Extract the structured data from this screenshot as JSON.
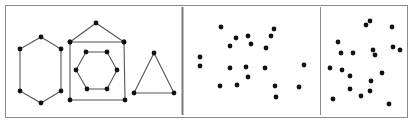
{
  "figure": {
    "frame": {
      "x": 5,
      "y": 5,
      "width": 402,
      "height": 112,
      "stroke": "#8a8a8a"
    },
    "separators": [
      {
        "x": 182.5,
        "y1": 7,
        "y2": 115,
        "stroke": "#7a7a7a",
        "width": 2
      },
      {
        "x": 320.5,
        "y1": 7,
        "y2": 115,
        "stroke": "#8a8a8a",
        "width": 1
      }
    ],
    "colors": {
      "edge": "#555555",
      "node": "#111111",
      "background": "#ffffff"
    },
    "panels": [
      {
        "name": "graph-panel",
        "shapes": [
          {
            "name": "hexagon-outer",
            "points": [
              [
                41,
                37
              ],
              [
                61,
                49
              ],
              [
                61,
                91
              ],
              [
                41,
                103
              ],
              [
                20,
                91
              ],
              [
                20,
                49
              ]
            ]
          },
          {
            "name": "house-roof",
            "points": [
              [
                70,
                42
              ],
              [
                96,
                23
              ],
              [
                124,
                42
              ]
            ],
            "open": true
          },
          {
            "name": "house-square",
            "points": [
              [
                70,
                42
              ],
              [
                124,
                42
              ],
              [
                125,
                100
              ],
              [
                70,
                100
              ]
            ]
          },
          {
            "name": "hexagon-inner",
            "points": [
              [
                86,
                52
              ],
              [
                107,
                52
              ],
              [
                117,
                70
              ],
              [
                107,
                89
              ],
              [
                87,
                89
              ],
              [
                76,
                70
              ]
            ]
          },
          {
            "name": "triangle",
            "points": [
              [
                154,
                53
              ],
              [
                174,
                93
              ],
              [
                134,
                93
              ]
            ]
          }
        ]
      },
      {
        "name": "scatter-panel-middle",
        "points": [
          [
            221,
            27
          ],
          [
            274,
            29
          ],
          [
            271,
            36
          ],
          [
            236,
            38
          ],
          [
            248,
            36
          ],
          [
            251,
            44
          ],
          [
            230,
            46
          ],
          [
            266,
            48
          ],
          [
            200,
            57
          ],
          [
            200,
            66
          ],
          [
            230,
            68
          ],
          [
            246,
            67
          ],
          [
            265,
            68
          ],
          [
            304,
            65
          ],
          [
            248,
            77
          ],
          [
            220,
            86
          ],
          [
            237,
            85
          ],
          [
            275,
            86
          ],
          [
            299,
            87
          ],
          [
            276,
            97
          ]
        ]
      },
      {
        "name": "scatter-panel-right",
        "points": [
          [
            366,
            25
          ],
          [
            370,
            21
          ],
          [
            392,
            27
          ],
          [
            338,
            42
          ],
          [
            341,
            53
          ],
          [
            353,
            53
          ],
          [
            373,
            50
          ],
          [
            375,
            55
          ],
          [
            393,
            47
          ],
          [
            400,
            50
          ],
          [
            330,
            68
          ],
          [
            342,
            70
          ],
          [
            350,
            76
          ],
          [
            382,
            73
          ],
          [
            371,
            81
          ],
          [
            350,
            89
          ],
          [
            361,
            96
          ],
          [
            370,
            91
          ],
          [
            333,
            99
          ],
          [
            389,
            104
          ]
        ]
      }
    ],
    "node_radius": 2.4
  }
}
